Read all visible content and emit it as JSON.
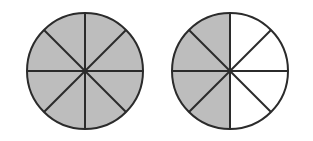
{
  "figure": {
    "background_color": "#ffffff",
    "shaded_color": "#bdbdbd",
    "unshaded_color": "#ffffff",
    "outline_color": "#2b2b2b",
    "stroke_width": 2,
    "circles": [
      {
        "id": "circle-left",
        "label": "Left fraction circle",
        "center_x": 85,
        "center_y": 71,
        "radius": 58,
        "total_sectors": 8,
        "shaded_sectors": 8,
        "fraction_text": "8/8",
        "sectors": [
          {
            "index": 0,
            "start_angle": -90,
            "end_angle": -45,
            "shaded": true
          },
          {
            "index": 1,
            "start_angle": -45,
            "end_angle": 0,
            "shaded": true
          },
          {
            "index": 2,
            "start_angle": 0,
            "end_angle": 45,
            "shaded": true
          },
          {
            "index": 3,
            "start_angle": 45,
            "end_angle": 90,
            "shaded": true
          },
          {
            "index": 4,
            "start_angle": 90,
            "end_angle": 135,
            "shaded": true
          },
          {
            "index": 5,
            "start_angle": 135,
            "end_angle": 180,
            "shaded": true
          },
          {
            "index": 6,
            "start_angle": 180,
            "end_angle": 225,
            "shaded": true
          },
          {
            "index": 7,
            "start_angle": 225,
            "end_angle": 270,
            "shaded": true
          }
        ],
        "divider_angles": [
          0,
          45,
          90,
          135
        ]
      },
      {
        "id": "circle-right",
        "label": "Right fraction circle",
        "center_x": 230,
        "center_y": 71,
        "radius": 58,
        "total_sectors": 8,
        "shaded_sectors": 4,
        "fraction_text": "4/8",
        "sectors": [
          {
            "index": 0,
            "start_angle": -90,
            "end_angle": -45,
            "shaded": false
          },
          {
            "index": 1,
            "start_angle": -45,
            "end_angle": 0,
            "shaded": false
          },
          {
            "index": 2,
            "start_angle": 0,
            "end_angle": 45,
            "shaded": false
          },
          {
            "index": 3,
            "start_angle": 45,
            "end_angle": 90,
            "shaded": false
          },
          {
            "index": 4,
            "start_angle": 90,
            "end_angle": 135,
            "shaded": true
          },
          {
            "index": 5,
            "start_angle": 135,
            "end_angle": 180,
            "shaded": true
          },
          {
            "index": 6,
            "start_angle": 180,
            "end_angle": 225,
            "shaded": true
          },
          {
            "index": 7,
            "start_angle": 225,
            "end_angle": 270,
            "shaded": true
          }
        ],
        "divider_angles": [
          0,
          45,
          90,
          135
        ]
      }
    ]
  }
}
